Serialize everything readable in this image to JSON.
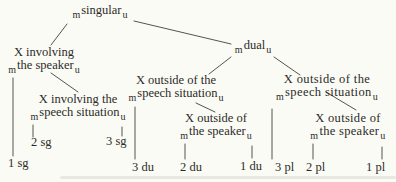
{
  "diagram": {
    "type": "tree",
    "description_labels": {
      "marked_subscript": "m",
      "unmarked_subscript": "u"
    },
    "nodes": {
      "singular": {
        "pre": "m",
        "label": "singular",
        "post": "u"
      },
      "dual": {
        "pre": "m",
        "label": "dual",
        "post": "u"
      },
      "inv_speaker": {
        "line1": "X involving",
        "pre": "m",
        "line2": "the speaker",
        "post": "u"
      },
      "inv_speech": {
        "line1": "X involving the",
        "pre": "m",
        "line2": "speech situation",
        "post": "u"
      },
      "out_speech_mid": {
        "line1": "X outside of the",
        "pre": "m",
        "line2": "speech situation",
        "post": "u"
      },
      "out_speaker_mid": {
        "line1": "X outside of",
        "pre": "m",
        "line2": "the speaker",
        "post": "u"
      },
      "out_speech_right": {
        "line1": "X outside of the",
        "pre": "m",
        "line2": "speech situation",
        "post": "u"
      },
      "out_speaker_right": {
        "line1": "X outside of",
        "pre": "m",
        "line2": "the speaker",
        "post": "u"
      }
    },
    "leaves": [
      "1 sg",
      "2 sg",
      "3 sg",
      "3 du",
      "2 du",
      "1 du",
      "3 pl",
      "2 pl",
      "1 pl"
    ],
    "edges": [
      [
        "singular",
        "inv_speaker"
      ],
      [
        "singular",
        "dual"
      ],
      [
        "inv_speaker",
        "inv_speech"
      ],
      [
        "inv_speaker",
        "1 sg"
      ],
      [
        "inv_speech",
        "2 sg"
      ],
      [
        "inv_speech",
        "3 sg"
      ],
      [
        "dual",
        "out_speech_mid"
      ],
      [
        "dual",
        "out_speech_right"
      ],
      [
        "out_speech_mid",
        "out_speaker_mid"
      ],
      [
        "out_speech_mid",
        "3 du"
      ],
      [
        "out_speaker_mid",
        "2 du"
      ],
      [
        "out_speaker_mid",
        "1 du"
      ],
      [
        "out_speech_right",
        "out_speaker_right"
      ],
      [
        "out_speech_right",
        "3 pl"
      ],
      [
        "out_speaker_right",
        "2 pl"
      ],
      [
        "out_speaker_right",
        "1 pl"
      ]
    ],
    "colors": {
      "background": "#fbfbf6",
      "text": "#2b2b27",
      "line": "#56534c"
    }
  }
}
